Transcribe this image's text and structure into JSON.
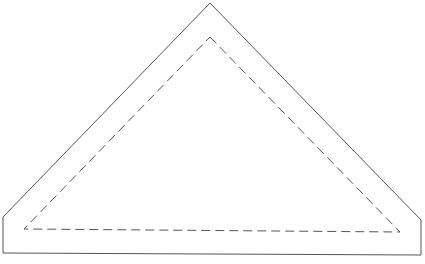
{
  "diagram": {
    "type": "sewing-pattern-piece",
    "colors": {
      "background": "#ffffff",
      "cut_line": "#555555",
      "seam_line": "#555555"
    },
    "cut_line": {
      "style": "solid",
      "points": [
        [
          210,
          3
        ],
        [
          421,
          220
        ],
        [
          421,
          255
        ],
        [
          3,
          253
        ],
        [
          3,
          217
        ],
        [
          210,
          3
        ]
      ]
    },
    "seam_line": {
      "style": "dashed",
      "points": [
        [
          210,
          37
        ],
        [
          400,
          232
        ],
        [
          24,
          229
        ],
        [
          210,
          37
        ]
      ]
    }
  }
}
